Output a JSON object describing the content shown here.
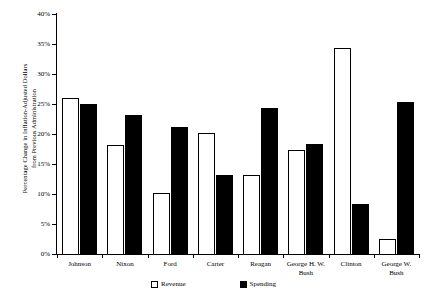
{
  "chart_data": {
    "type": "bar",
    "title": "",
    "xlabel": "",
    "ylabel": "Percentage Change in Inflation-Adjusted Dollars from Previous Administration",
    "ylabel_line1": "Percentage Change in Inflation-Adjusted Dollars",
    "ylabel_line2": "from Previous Administration",
    "ylim": [
      0,
      40
    ],
    "ytick_labels": [
      "40%",
      "35%",
      "30%",
      "25%",
      "20%",
      "15%",
      "10%",
      "5%",
      "0%"
    ],
    "ytick_values": [
      40,
      35,
      30,
      25,
      20,
      15,
      10,
      5,
      0
    ],
    "grid": false,
    "legend_position": "bottom-center",
    "categories": [
      "Johnson",
      "Nixon",
      "Ford",
      "Carter",
      "Reagan",
      "George H. W. Bush",
      "Clinton",
      "George W. Bush"
    ],
    "category_lines": [
      [
        "Johnson"
      ],
      [
        "Nixon"
      ],
      [
        "Ford"
      ],
      [
        "Carter"
      ],
      [
        "Reagan"
      ],
      [
        "George H. W.",
        "Bush"
      ],
      [
        "Clinton"
      ],
      [
        "George W.",
        "Bush"
      ]
    ],
    "series": [
      {
        "name": "Revenue",
        "color": "#ffffff",
        "edge_color": "#000000",
        "values": [
          26.0,
          18.2,
          10.1,
          20.2,
          13.2,
          17.4,
          34.4,
          2.5
        ]
      },
      {
        "name": "Spending",
        "color": "#000000",
        "edge_color": "#000000",
        "values": [
          25.0,
          23.1,
          21.1,
          13.2,
          24.3,
          18.4,
          8.4,
          25.4
        ]
      }
    ]
  },
  "legend": {
    "items": [
      {
        "label": "Revenue",
        "swatch": "white-square"
      },
      {
        "label": "Spending",
        "swatch": "black-square"
      }
    ]
  }
}
